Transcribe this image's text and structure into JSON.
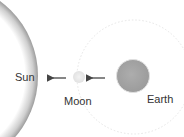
{
  "diagram": {
    "bodies": [
      {
        "id": "sun",
        "label": "Sun",
        "color": "#ffffff",
        "shadow": "#9a9a9a"
      },
      {
        "id": "moon",
        "label": "Moon",
        "color": "#eeeeee"
      },
      {
        "id": "earth",
        "label": "Earth",
        "color": "#a9a9a9"
      }
    ],
    "arrows": [
      {
        "from": "earth",
        "to": "moon",
        "color": "#444444"
      },
      {
        "from": "moon",
        "to": "sun",
        "color": "#444444"
      }
    ],
    "orbit": {
      "around": "earth",
      "style": "dotted",
      "color": "#e4e4e4"
    }
  }
}
